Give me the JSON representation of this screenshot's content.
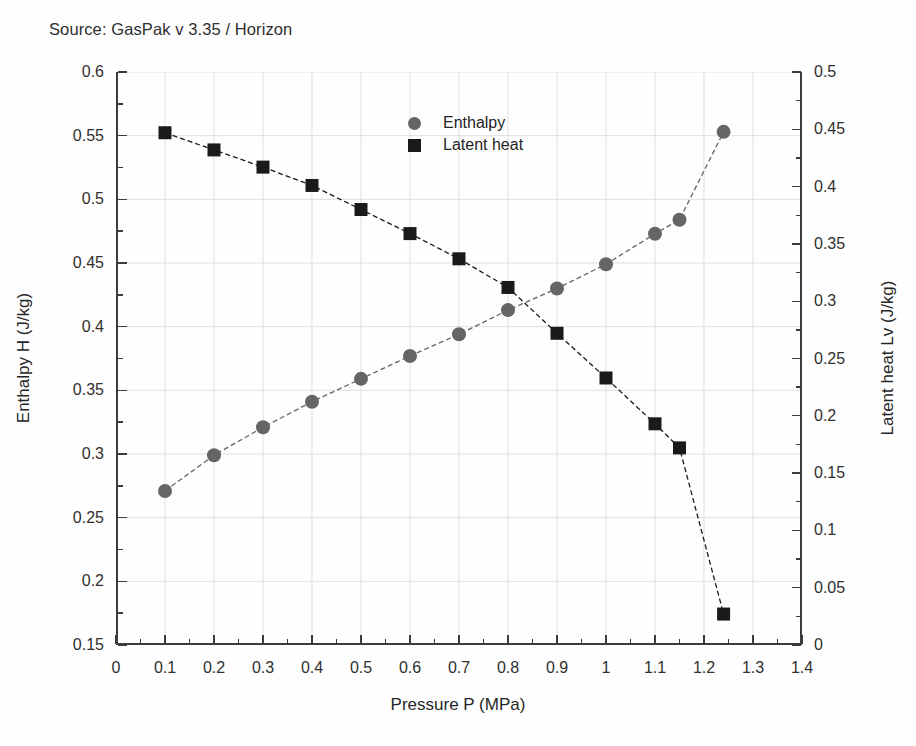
{
  "source_note": "Source: GasPak v 3.35 / Horizon",
  "legend": {
    "position": "upper-center",
    "items": [
      {
        "label": "Enthalpy",
        "marker": "circle",
        "color": "#656565"
      },
      {
        "label": "Latent heat",
        "marker": "square",
        "color": "#1a1a1a"
      }
    ]
  },
  "axes": {
    "x": {
      "label": "Pressure P (MPa)",
      "ticks": [
        "0",
        "0.1",
        "0.2",
        "0.3",
        "0.4",
        "0.5",
        "0.6",
        "0.7",
        "0.8",
        "0.9",
        "1",
        "1.1",
        "1.2",
        "1.3",
        "1.4"
      ]
    },
    "y_left": {
      "label": "Enthalpy H (J/kg)",
      "ticks": [
        "0.6",
        "0.55",
        "0.5",
        "0.45",
        "0.4",
        "0.35",
        "0.3",
        "0.25",
        "0.2",
        "0.15"
      ]
    },
    "y_right": {
      "label": "Latent heat Lv (J/kg)",
      "ticks": [
        "0.5",
        "0.45",
        "0.4",
        "0.35",
        "0.3",
        "0.25",
        "0.2",
        "0.15",
        "0.1",
        "0.05",
        "0"
      ]
    }
  },
  "chart_data": {
    "type": "line",
    "title": "",
    "subtitle": "Source: GasPak v 3.35 / Horizon",
    "xlabel": "Pressure P (MPa)",
    "ylabel": "Enthalpy H (J/kg)",
    "y2label": "Latent heat Lv (J/kg)",
    "xlim": [
      0,
      1.4
    ],
    "ylim": [
      0.15,
      0.6
    ],
    "y2lim": [
      0,
      0.5
    ],
    "xticks": [
      0,
      0.1,
      0.2,
      0.3,
      0.4,
      0.5,
      0.6,
      0.7,
      0.8,
      0.9,
      1.0,
      1.1,
      1.2,
      1.3,
      1.4
    ],
    "yticks": [
      0.15,
      0.2,
      0.25,
      0.3,
      0.35,
      0.4,
      0.45,
      0.5,
      0.55,
      0.6
    ],
    "y2ticks": [
      0,
      0.05,
      0.1,
      0.15,
      0.2,
      0.25,
      0.3,
      0.35,
      0.4,
      0.45,
      0.5
    ],
    "minor_ticks": true,
    "grid": true,
    "legend_position": "upper center",
    "x": [
      0.1,
      0.2,
      0.3,
      0.4,
      0.5,
      0.6,
      0.7,
      0.8,
      0.9,
      1.0,
      1.1,
      1.15,
      1.24
    ],
    "series": [
      {
        "name": "Enthalpy",
        "axis": "left",
        "marker": "circle",
        "color": "#656565",
        "linestyle": "dashed",
        "values": [
          0.271,
          0.299,
          0.321,
          0.341,
          0.359,
          0.377,
          0.394,
          0.413,
          0.43,
          0.449,
          0.473,
          0.484,
          0.553
        ]
      },
      {
        "name": "Latent heat",
        "axis": "right",
        "marker": "square",
        "color": "#1a1a1a",
        "linestyle": "dashed",
        "values": [
          0.447,
          0.432,
          0.417,
          0.401,
          0.38,
          0.359,
          0.337,
          0.312,
          0.272,
          0.233,
          0.193,
          0.172,
          0.027
        ]
      }
    ]
  }
}
